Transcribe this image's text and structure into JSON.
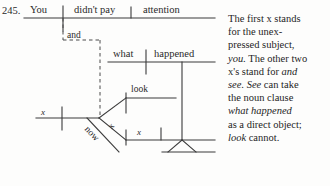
{
  "item": {
    "number": "245.",
    "sentence": "You didn't pay attention and x look now x see what happened"
  },
  "diagram": {
    "main_clause": {
      "subject": "You",
      "predicate": "didn't pay",
      "object": "attention"
    },
    "conjunction": "and",
    "subordinate_clause": {
      "subject": "what",
      "predicate": "happened"
    },
    "second_clause": {
      "subject": "x",
      "modifier": "now",
      "verb_upper": "look",
      "verb_upper_marker": "x",
      "verb_lower_marker": "x"
    }
  },
  "note": {
    "lines": [
      "The first x stands",
      "for the unex-",
      "pressed subject,",
      "you. The other two",
      "x's stand for and",
      "see. See can take",
      "the noun clause",
      "what happened",
      "as a direct object;",
      "look cannot."
    ],
    "full_text": "The first x stands for the unexpressed subject, you. The other two x's stand for and see. See can take the noun clause what happened as a direct object; look cannot."
  },
  "colors": {
    "ink": "#2a2a2a",
    "paper": "#fdfdfc"
  }
}
